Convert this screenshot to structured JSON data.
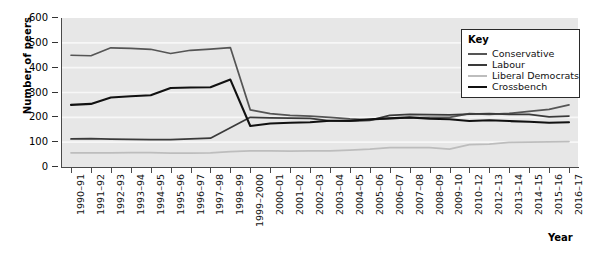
{
  "chart_data": {
    "type": "line",
    "title": "",
    "xlabel": "Year",
    "ylabel": "Number of peers",
    "ylim": [
      0,
      600
    ],
    "yticks": [
      0,
      100,
      200,
      300,
      400,
      500,
      600
    ],
    "grid": true,
    "legend_position": "top-right",
    "legend_title": "Key",
    "categories": [
      "1990–91",
      "1991–92",
      "1992–93",
      "1993–94",
      "1994–95",
      "1995–96",
      "1996–97",
      "1997–98",
      "1998–99",
      "1999–2000",
      "2000–01",
      "2001–02",
      "2002–03",
      "2003–04",
      "2004–05",
      "2005–06",
      "2006–07",
      "2007–08",
      "2008–09",
      "2009–10",
      "2010–12",
      "2012–13",
      "2013–14",
      "2014–15",
      "2015–16",
      "2016–17"
    ],
    "series": [
      {
        "name": "Conservative",
        "color": "#555555",
        "values": [
          450,
          448,
          480,
          478,
          474,
          457,
          470,
          475,
          481,
          230,
          215,
          208,
          205,
          200,
          194,
          190,
          196,
          198,
          200,
          200,
          215,
          212,
          216,
          224,
          232,
          250
        ]
      },
      {
        "name": "Labour",
        "color": "#3a3a3a",
        "values": [
          113,
          114,
          112,
          111,
          110,
          110,
          113,
          116,
          158,
          200,
          198,
          197,
          196,
          186,
          185,
          188,
          208,
          212,
          211,
          210,
          213,
          215,
          212,
          212,
          202,
          205
        ]
      },
      {
        "name": "Liberal Democrats",
        "color": "#bdbdbd",
        "values": [
          57,
          57,
          57,
          58,
          58,
          56,
          56,
          57,
          62,
          65,
          65,
          64,
          65,
          65,
          68,
          72,
          78,
          78,
          78,
          72,
          90,
          92,
          99,
          100,
          101,
          102
        ]
      },
      {
        "name": "Crossbench",
        "color": "#111111",
        "values": [
          250,
          254,
          280,
          285,
          289,
          318,
          320,
          321,
          352,
          165,
          175,
          178,
          180,
          186,
          186,
          192,
          196,
          200,
          194,
          192,
          185,
          188,
          185,
          182,
          178,
          180
        ]
      }
    ]
  }
}
